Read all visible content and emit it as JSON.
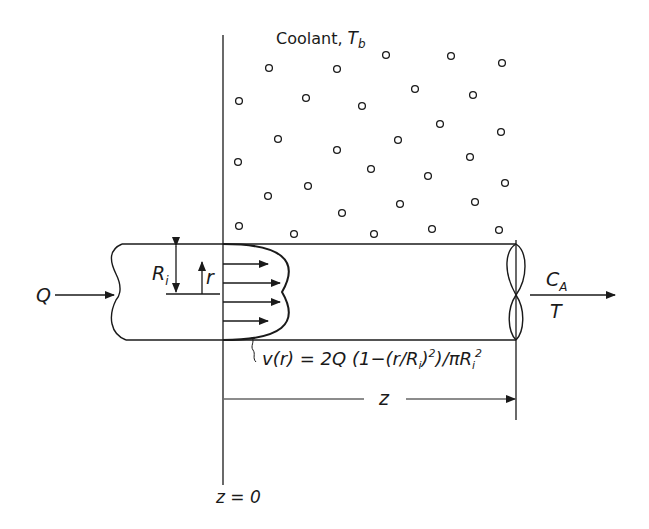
{
  "diagram": {
    "type": "tubular-reactor-laminar-flow",
    "colors": {
      "ink": "#1a1a1a",
      "background": "#ffffff"
    },
    "labels": {
      "coolant": "Coolant, ",
      "coolant_temp": "T",
      "coolant_temp_sub": "b",
      "inlet_flow": "Q",
      "radius": "R",
      "radius_sub": "i",
      "radial_coord": "r",
      "outlet_conc": "C",
      "outlet_conc_sub": "A",
      "outlet_temp": "T",
      "axial_distance": "z",
      "origin": "z = 0",
      "velocity_equation": "v(r) = 2Q (1−(r/R",
      "velocity_equation_part2": ")",
      "velocity_equation_part3": ")/πR",
      "eq_sub_i": "i",
      "eq_sup_2": "2"
    },
    "coolant_particles": [
      [
        269,
        68
      ],
      [
        337,
        69
      ],
      [
        386,
        55
      ],
      [
        451,
        56
      ],
      [
        502,
        63
      ],
      [
        239,
        101
      ],
      [
        306,
        98
      ],
      [
        362,
        106
      ],
      [
        415,
        89
      ],
      [
        473,
        95
      ],
      [
        278,
        139
      ],
      [
        398,
        140
      ],
      [
        440,
        124
      ],
      [
        501,
        132
      ],
      [
        238,
        162
      ],
      [
        337,
        150
      ],
      [
        371,
        169
      ],
      [
        470,
        157
      ],
      [
        428,
        176
      ],
      [
        308,
        186
      ],
      [
        268,
        196
      ],
      [
        400,
        204
      ],
      [
        475,
        202
      ],
      [
        505,
        183
      ],
      [
        342,
        213
      ],
      [
        239,
        226
      ],
      [
        294,
        234
      ],
      [
        374,
        234
      ],
      [
        432,
        229
      ],
      [
        499,
        230
      ]
    ]
  }
}
